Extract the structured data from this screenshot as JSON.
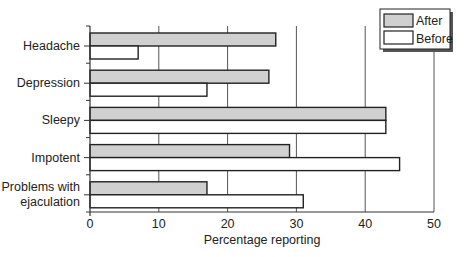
{
  "chart_data": {
    "type": "bar",
    "orientation": "horizontal",
    "title": "",
    "xlabel": "Percentage reporting",
    "ylabel": "",
    "xlim": [
      0,
      50
    ],
    "xticks": [
      0,
      10,
      20,
      30,
      40,
      50
    ],
    "grid": "vertical",
    "legend_position": "top-right",
    "categories": [
      "Headache",
      "Depression",
      "Sleepy",
      "Impotent",
      "Problems with ejaculation"
    ],
    "category_lines": [
      [
        "Headache"
      ],
      [
        "Depression"
      ],
      [
        "Sleepy"
      ],
      [
        "Impotent"
      ],
      [
        "Problems with",
        "ejaculation"
      ]
    ],
    "series": [
      {
        "name": "After",
        "color": "#d0d0d0",
        "values": [
          27,
          26,
          43,
          29,
          17
        ]
      },
      {
        "name": "Before",
        "color": "#ffffff",
        "values": [
          7,
          17,
          43,
          45,
          31
        ]
      }
    ]
  },
  "legend": {
    "items": [
      {
        "label": "After",
        "color": "#d0d0d0"
      },
      {
        "label": "Before",
        "color": "#ffffff"
      }
    ]
  },
  "colors": {
    "bar_stroke": "#222222",
    "grid": "#555555",
    "axis": "#333333"
  }
}
